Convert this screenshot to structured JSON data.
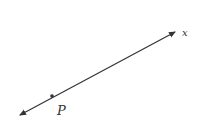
{
  "diagram": {
    "type": "line-with-point",
    "line": {
      "label": "x",
      "arrows": "both",
      "color": "#333333"
    },
    "point": {
      "label": "P",
      "color": "#333333"
    }
  }
}
